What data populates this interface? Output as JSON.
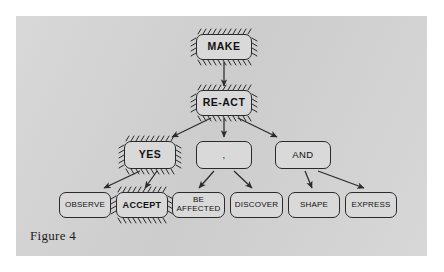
{
  "figure": {
    "caption": "Figure 4",
    "panel_color": "#d4d4d4",
    "node_fill": "#d9d9d9",
    "stroke_color": "#2a2a2a",
    "page_background": "#ffffff"
  },
  "diagram": {
    "type": "tree",
    "title": "Figure 4",
    "levels": [
      {
        "index": 0,
        "nodes": [
          "make"
        ]
      },
      {
        "index": 1,
        "nodes": [
          "react"
        ]
      },
      {
        "index": 2,
        "nodes": [
          "yes",
          "comma",
          "and"
        ]
      },
      {
        "index": 3,
        "nodes": [
          "observe",
          "accept",
          "be-affected",
          "discover",
          "shape",
          "express"
        ]
      }
    ],
    "nodes": [
      {
        "id": "make",
        "label": "MAKE",
        "level": 0,
        "emphasis": "hatched",
        "bold": true,
        "x": 196,
        "y": 34,
        "w": 56,
        "h": 26
      },
      {
        "id": "react",
        "label": "RE-ACT",
        "level": 1,
        "emphasis": "hatched",
        "bold": true,
        "x": 196,
        "y": 90,
        "w": 56,
        "h": 26
      },
      {
        "id": "yes",
        "label": "YES",
        "level": 2,
        "emphasis": "hatched",
        "bold": true,
        "x": 124,
        "y": 141,
        "w": 52,
        "h": 28
      },
      {
        "id": "comma",
        "label": ",",
        "level": 2,
        "emphasis": "plain",
        "bold": false,
        "x": 196,
        "y": 141,
        "w": 56,
        "h": 28
      },
      {
        "id": "and",
        "label": "AND",
        "level": 2,
        "emphasis": "plain",
        "bold": false,
        "x": 275,
        "y": 141,
        "w": 56,
        "h": 28
      },
      {
        "id": "observe",
        "label": "OBSERVE",
        "level": 3,
        "emphasis": "plain",
        "bold": false,
        "x": 59,
        "y": 192,
        "w": 52,
        "h": 26
      },
      {
        "id": "accept",
        "label": "ACCEPT",
        "level": 3,
        "emphasis": "hatched",
        "bold": true,
        "x": 116,
        "y": 192,
        "w": 52,
        "h": 26
      },
      {
        "id": "be-affected",
        "label": "BE AFFECTED",
        "level": 3,
        "emphasis": "plain",
        "bold": false,
        "x": 172,
        "y": 192,
        "w": 53,
        "h": 26
      },
      {
        "id": "discover",
        "label": "DISCOVER",
        "level": 3,
        "emphasis": "plain",
        "bold": false,
        "x": 230,
        "y": 192,
        "w": 53,
        "h": 26
      },
      {
        "id": "shape",
        "label": "SHAPE",
        "level": 3,
        "emphasis": "plain",
        "bold": false,
        "x": 288,
        "y": 192,
        "w": 52,
        "h": 26
      },
      {
        "id": "express",
        "label": "EXPRESS",
        "level": 3,
        "emphasis": "plain",
        "bold": false,
        "x": 345,
        "y": 192,
        "w": 52,
        "h": 26
      }
    ],
    "edges": [
      {
        "from": "make",
        "to": "react"
      },
      {
        "from": "react",
        "to": "yes"
      },
      {
        "from": "react",
        "to": "comma"
      },
      {
        "from": "react",
        "to": "and"
      },
      {
        "from": "yes",
        "to": "observe"
      },
      {
        "from": "yes",
        "to": "accept"
      },
      {
        "from": "comma",
        "to": "be-affected"
      },
      {
        "from": "comma",
        "to": "discover"
      },
      {
        "from": "and",
        "to": "shape"
      },
      {
        "from": "and",
        "to": "express"
      }
    ],
    "labels": {
      "make": "MAKE",
      "react": "RE-ACT",
      "yes": "YES",
      "comma": ",",
      "and": "AND",
      "observe": "OBSERVE",
      "accept": "ACCEPT",
      "be_affected_line1": "BE",
      "be_affected_line2": "AFFECTED",
      "discover": "DISCOVER",
      "shape": "SHAPE",
      "express": "EXPRESS"
    }
  }
}
